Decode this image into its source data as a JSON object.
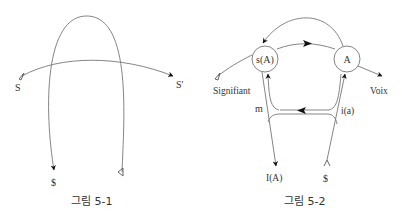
{
  "figure1": {
    "caption": "그림 5-1",
    "labels": {
      "start": "S",
      "end": "S'",
      "subject": "$"
    }
  },
  "figure2": {
    "caption": "그림 5-2",
    "nodes": {
      "left": "s(A)",
      "right": "A"
    },
    "labels": {
      "signifiant": "Signifiant",
      "voix": "Voix",
      "m": "m",
      "ia": "i(a)",
      "IA": "I(A)",
      "subject": "$"
    }
  },
  "colors": {
    "line": "#777777",
    "text": "#333333",
    "arrow": "#111111"
  }
}
